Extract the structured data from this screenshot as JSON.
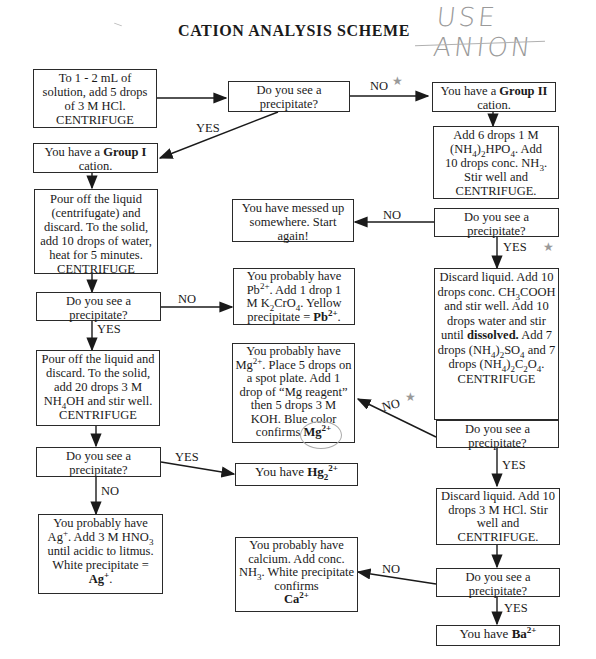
{
  "header": {
    "title": "CATION ANALYSIS SCHEME",
    "handwritten_note": "USE ANION"
  },
  "nodes": {
    "start": {
      "text": "To 1 - 2 mL of solution, add 5 drops of 3 M HCl. CENTRIFUGE"
    },
    "q1": {
      "text": "Do you see a precipitate?"
    },
    "group1": {
      "prefix": "You have a ",
      "bold": "Group I",
      "suffix": " cation."
    },
    "group2": {
      "prefix": "You have a ",
      "bold": "Group II",
      "suffix": " cation."
    },
    "g1_step1": {
      "text": "Pour off the liquid (centrifugate) and discard. To the solid, add 10 drops of water, heat for 5 minutes. CENTRIFUGE"
    },
    "g2_step1": {
      "line1": "Add 6 drops 1 M",
      "line2a": "(NH",
      "line2b": "4",
      "line2c": ")",
      "line2d": "2",
      "line2e": "HPO",
      "line2f": "4",
      "line2g": ". Add",
      "line3a": "10 drops conc. NH",
      "line3b": "3",
      "line3c": ".",
      "line4": "Stir well and",
      "line5": "CENTRIFUGE."
    },
    "g2_q1": {
      "text": "Do you see a precipitate?"
    },
    "messed_up": {
      "text": "You have messed up somewhere. Start again!"
    },
    "g1_q1": {
      "text": "Do you see a precipitate?"
    },
    "pb": {
      "l1": "You probably have",
      "l2a": "Pb",
      "l2sup": "2+",
      "l2b": ". Add 1 drop 1",
      "l3a": "M K",
      "l3sub1": "2",
      "l3b": "CrO",
      "l3sub2": "4",
      "l3c": ". Yellow",
      "l4a": "precipitate = ",
      "l4bold": "Pb",
      "l4sup": "2+",
      "l4c": "."
    },
    "g1_step2": {
      "l1": "Pour off the liquid and discard. To the solid, add 20 drops 3 M",
      "l2a": "NH",
      "l2sub": "4",
      "l2b": "OH and stir well.",
      "l3": "CENTRIFUGE"
    },
    "mg": {
      "l1": "You probably have",
      "l2a": "Mg",
      "l2sup": "2+",
      "l2b": ". Place 5 drops on a spot plate. Add 1 drop of “Mg reagent” then 5 drops 3 M KOH. Blue color confirms ",
      "l2bold": "Mg",
      "l2bsup": "2+"
    },
    "g2_step2": {
      "l1": "Discard liquid. Add 10 drops conc.",
      "l2a": "CH",
      "l2sub": "3",
      "l2b": "COOH and stir well. Add 10 drops water and stir until ",
      "l2bold": "dissolved.",
      "l2c": " Add 7 drops (NH",
      "l2sub2": "4",
      "l2d": ")",
      "l2sub3": "2",
      "l2e": "SO",
      "l2sub4": "4",
      "l2f": " and 7 drops (NH",
      "l2sub5": "4",
      "l2g": ")",
      "l2sub6": "2",
      "l2h": "C",
      "l2sub7": "2",
      "l2i": "O",
      "l2sub8": "4",
      "l2j": ".",
      "l3": "CENTRIFUGE"
    },
    "g2_q2": {
      "text": "Do you see a precipitate?"
    },
    "g1_q2": {
      "text": "Do you see a precipitate?"
    },
    "hg": {
      "prefix": "You have ",
      "bold": "Hg",
      "sub": "2",
      "sup": "2+"
    },
    "g2_step3": {
      "text": "Discard liquid. Add 10 drops 3 M HCl. Stir well and CENTRIFUGE."
    },
    "ag": {
      "l1": "You probably have",
      "l2a": "Ag",
      "l2sup": "+",
      "l2b": ". Add 3 M HNO",
      "l2sub": "3",
      "l3": "until acidic to litmus. White precipitate =",
      "l4bold": "Ag",
      "l4sup": "+",
      "l4c": "."
    },
    "ca": {
      "l1": "You probably have calcium. Add conc.",
      "l2a": "NH",
      "l2sub": "3",
      "l2b": ". White precipitate confirms",
      "l3bold": "Ca",
      "l3sup": "2+"
    },
    "g2_q3": {
      "text": "Do you see a precipitate?"
    },
    "ba": {
      "prefix": "You have ",
      "bold": "Ba",
      "sup": "2+"
    }
  },
  "edge_labels": {
    "q1_no": "NO",
    "q1_yes": "YES",
    "g2_q1_no": "NO",
    "g2_q1_yes": "YES",
    "g1_q1_no": "NO",
    "g1_q1_yes": "YES",
    "g2_q2_no": "NO",
    "g2_q2_yes": "YES",
    "g1_q2_yes": "YES",
    "g1_q2_no": "NO",
    "g2_q3_no": "NO",
    "g2_q3_yes": "YES"
  },
  "annotations": {
    "star": "★"
  }
}
